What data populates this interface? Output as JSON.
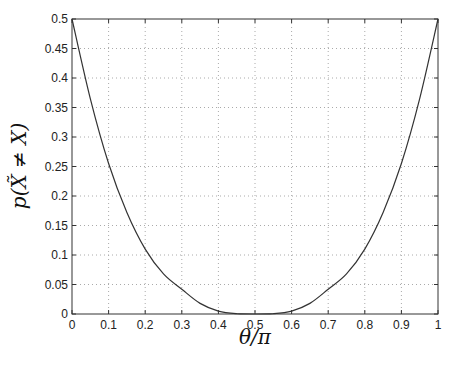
{
  "chart_data": {
    "type": "line",
    "title": "",
    "xlabel": "θ/π",
    "ylabel": "p(X̃ ≠ X)",
    "xlim": [
      0,
      1
    ],
    "ylim": [
      0,
      0.5
    ],
    "grid": true,
    "legend": null,
    "x_ticks": [
      "0",
      "0.1",
      "0.2",
      "0.3",
      "0.4",
      "0.5",
      "0.6",
      "0.7",
      "0.8",
      "0.9",
      "1"
    ],
    "y_ticks": [
      "0",
      "0.05",
      "0.1",
      "0.15",
      "0.2",
      "0.25",
      "0.3",
      "0.35",
      "0.4",
      "0.45",
      "0.5"
    ],
    "series": [
      {
        "name": "p(X̃ ≠ X)",
        "color": "#333333",
        "x": [
          0,
          0.05,
          0.1,
          0.15,
          0.2,
          0.25,
          0.3,
          0.35,
          0.4,
          0.45,
          0.5,
          0.55,
          0.6,
          0.65,
          0.7,
          0.75,
          0.8,
          0.85,
          0.9,
          0.95,
          1
        ],
        "y": [
          0.5,
          0.365,
          0.255,
          0.172,
          0.11,
          0.068,
          0.042,
          0.018,
          0.005,
          0.0005,
          0,
          0.0005,
          0.005,
          0.018,
          0.042,
          0.068,
          0.11,
          0.172,
          0.255,
          0.365,
          0.5
        ]
      }
    ]
  }
}
